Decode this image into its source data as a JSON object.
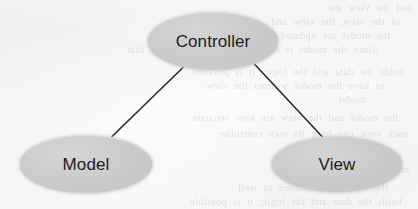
{
  "diagram": {
    "type": "mvc-triangle",
    "nodes": [
      {
        "id": "controller",
        "label": "Controller",
        "shape": "ellipse",
        "fill": "#c9c9c9",
        "text_color": "#1c1c1c"
      },
      {
        "id": "model",
        "label": "Model",
        "shape": "ellipse",
        "fill": "#c9c9c9",
        "text_color": "#1c1c1c"
      },
      {
        "id": "view",
        "label": "View",
        "shape": "ellipse",
        "fill": "#c9c9c9",
        "text_color": "#1c1c1c"
      }
    ],
    "edges": [
      {
        "id": "controller-model",
        "from": "Controller",
        "to": "Model",
        "style": "solid",
        "color": "#2a2a2a"
      },
      {
        "id": "controller-view",
        "from": "Controller",
        "to": "View",
        "style": "solid",
        "color": "#2a2a2a"
      }
    ]
  },
  "page": {
    "background_color": "#f7f7f6",
    "medium": "scanned-book-page",
    "showthrough": {
      "description": "faint mirrored text bleeding through from the reverse side of the page, largely illegible",
      "lines": [
        "and the view are",
        "of the view, the view and",
        "the model are updated as well",
        "Since the model is the part of the application that",
        "holds the data and the logic, it is possible",
        "to have the model without the view",
        "model",
        "the model and the view are kept separate",
        "each view can have its own controller",
        "controller"
      ]
    }
  }
}
